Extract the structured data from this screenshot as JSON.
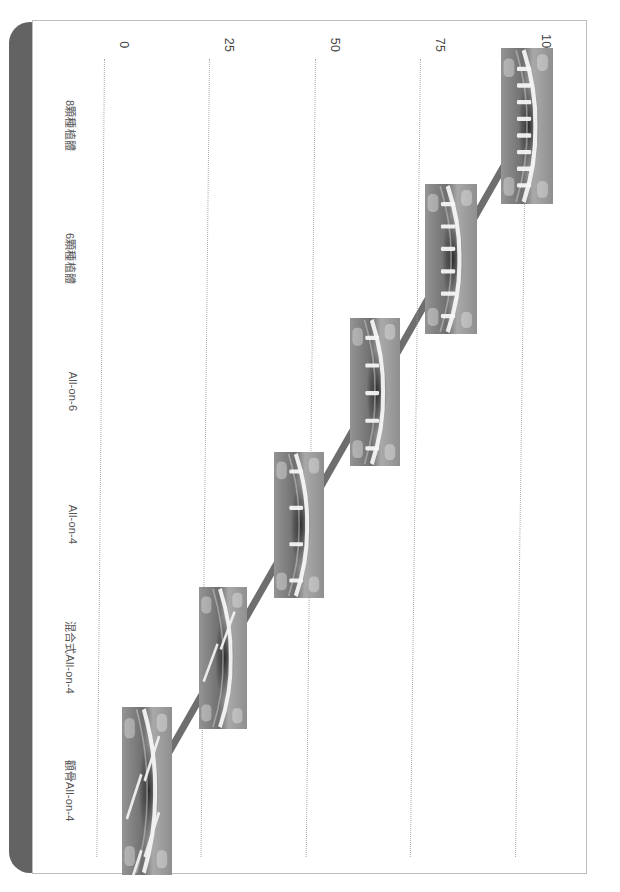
{
  "slide": {
    "background_color": "#ffffff",
    "border_color": "#bdbdbd",
    "side_bar_color": "#636363"
  },
  "chart_data": {
    "type": "line",
    "title": "",
    "subtitle": "",
    "xlabel": "",
    "ylabel": "",
    "orientation": "rotated-90-ccw",
    "grid": true,
    "legend": "none",
    "categories": [
      "8顆種植體",
      "6顆種植體",
      "All-on-6",
      "All-on-4",
      "混合式All-on-4",
      "顴骨All-on-4"
    ],
    "values": [
      100,
      82,
      64,
      46,
      28,
      10
    ],
    "series": [
      {
        "name": "種植體數量",
        "values": [
          100,
          82,
          64,
          46,
          28,
          10
        ],
        "line_color": "#6e6e6e",
        "line_width": 7
      }
    ],
    "ylim": [
      0,
      100
    ],
    "yticks": [
      0,
      25,
      50,
      75,
      100
    ],
    "ytick_labels": [
      "0",
      "25",
      "50",
      "75",
      "100"
    ],
    "markers": [
      {
        "category": "8顆種植體",
        "value": 100,
        "icon": "xray-8-implants"
      },
      {
        "category": "6顆種植體",
        "value": 82,
        "icon": "xray-6-implants"
      },
      {
        "category": "All-on-6",
        "value": 64,
        "icon": "xray-all-on-6"
      },
      {
        "category": "All-on-4",
        "value": 46,
        "icon": "xray-all-on-4"
      },
      {
        "category": "混合式All-on-4",
        "value": 28,
        "icon": "xray-hybrid-all-on-4"
      },
      {
        "category": "顴骨All-on-4",
        "value": 10,
        "icon": "xray-zygoma-all-on-4"
      }
    ],
    "grid_color": "#9e9e9e",
    "tick_text_color": "#3f3f3f",
    "category_text_color": "#555555"
  }
}
